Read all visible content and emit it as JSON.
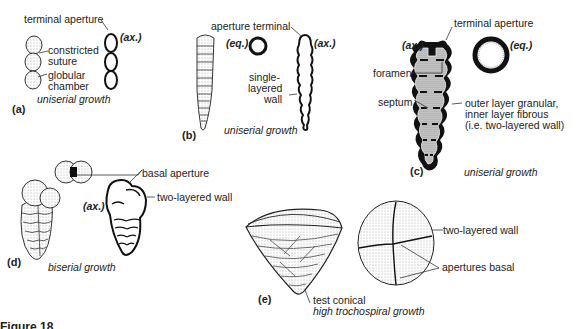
{
  "figure": {
    "caption_visible": "Figure 18.",
    "panels": [
      {
        "id": "a",
        "letter": "(a)",
        "growth": "uniserial growth",
        "labels": {
          "terminal_aperture": "terminal aperture",
          "axial": "(ax.)",
          "constricted": "constricted",
          "suture": "suture",
          "globular": "globular",
          "chamber": "chamber"
        }
      },
      {
        "id": "b",
        "letter": "(b)",
        "growth": "uniserial growth",
        "labels": {
          "aperture_terminal": "aperture terminal",
          "equatorial": "(eq.)",
          "axial": "(ax.)",
          "single": "single-",
          "layered": "layered",
          "wall": "wall"
        }
      },
      {
        "id": "c",
        "letter": "(c)",
        "growth": "uniserial growth",
        "labels": {
          "terminal_aperture": "terminal aperture",
          "axial": "(ax.)",
          "equatorial": "(eq.)",
          "foramen": "foramen",
          "septum": "septum",
          "outer": "outer layer granular,",
          "inner": "inner layer fibrous",
          "ie": "(i.e. two-layered wall)"
        }
      },
      {
        "id": "d",
        "letter": "(d)",
        "growth": "biserial growth",
        "labels": {
          "basal_aperture": "basal aperture",
          "axial": "(ax.)",
          "two_layered_wall": "two-layered wall"
        }
      },
      {
        "id": "e",
        "letter": "(e)",
        "growth": "high trochospiral growth",
        "labels": {
          "test_conical": "test conical",
          "two_layered_wall": "two-layered wall",
          "apertures_basal": "apertures basal"
        }
      }
    ]
  }
}
